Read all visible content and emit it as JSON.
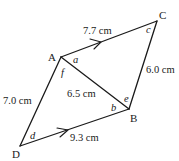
{
  "diagram": {
    "vertices": {
      "A": {
        "label": "A",
        "x": 61,
        "y": 57
      },
      "B": {
        "label": "B",
        "x": 129,
        "y": 109
      },
      "C": {
        "label": "C",
        "x": 157,
        "y": 21
      },
      "D": {
        "label": "D",
        "x": 20,
        "y": 146
      }
    },
    "sides": {
      "AC": {
        "length": "7.7 cm",
        "parallel_arrow": true
      },
      "CB": {
        "length": "6.0 cm"
      },
      "AB": {
        "length": "6.5 cm"
      },
      "AD": {
        "length": "7.0 cm"
      },
      "DB": {
        "length": "9.3 cm",
        "parallel_arrow": true
      }
    },
    "angles": {
      "a": "a",
      "b": "b",
      "c": "c",
      "d": "d",
      "e": "e",
      "f": "f"
    }
  }
}
